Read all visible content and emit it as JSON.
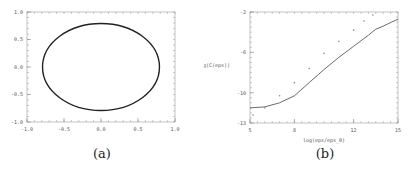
{
  "captions": {
    "a": "(a)",
    "b": "(b)"
  },
  "chart_data": [
    {
      "type": "line",
      "id": "a",
      "title": "",
      "xlabel": "",
      "ylabel": "",
      "xlim": [
        -1.0,
        1.0
      ],
      "ylim": [
        -1.0,
        1.0
      ],
      "xticks": [
        "-1.0",
        "-0.5",
        "0.0",
        "0.5",
        "1.0"
      ],
      "yticks": [
        "1.0",
        "0.5",
        "0.0",
        "-0.5",
        "-1.0"
      ],
      "grid": false,
      "series": [
        {
          "name": "closed orbit",
          "shape": "ellipse",
          "center": [
            0.0,
            0.0
          ],
          "rx": 0.79,
          "ry": 0.79,
          "color": "#222222"
        }
      ]
    },
    {
      "type": "line",
      "id": "b",
      "title": "",
      "xlabel": "log(eps/eps_0)",
      "ylabel": "log(C(eps))",
      "xlim": [
        5,
        15
      ],
      "ylim": [
        -13,
        -2
      ],
      "xticks": [
        "5",
        "8",
        "12",
        "15"
      ],
      "yticks": [
        "-2",
        "-6",
        "-10",
        "-13"
      ],
      "grid": false,
      "series": [
        {
          "name": "solid",
          "style": "solid",
          "color": "#444444",
          "x": [
            5,
            6,
            7,
            8,
            9,
            10,
            11,
            12,
            13,
            13.5,
            14,
            15
          ],
          "y": [
            -11.5,
            -11.4,
            -11.0,
            -10.3,
            -9.0,
            -7.7,
            -6.5,
            -5.4,
            -4.3,
            -3.7,
            -3.4,
            -2.7
          ]
        },
        {
          "name": "dotted",
          "style": "dotted",
          "color": "#888888",
          "x": [
            5.2,
            6,
            7,
            8,
            9,
            10,
            11,
            12,
            12.7,
            13.3
          ],
          "y": [
            -12.2,
            -11.5,
            -10.3,
            -9.0,
            -7.6,
            -6.1,
            -4.9,
            -3.8,
            -2.9,
            -2.3
          ]
        }
      ]
    }
  ]
}
